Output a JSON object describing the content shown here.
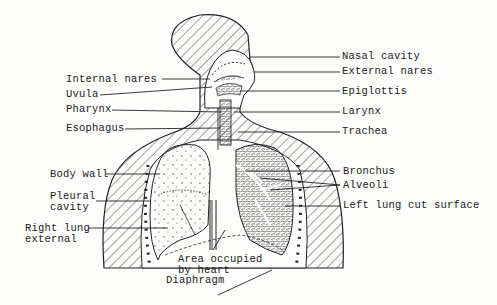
{
  "diagram": {
    "labels_left": {
      "internal_nares": "Internal nares",
      "uvula": "Uvula",
      "pharynx": "Pharynx",
      "esophagus": "Esophagus",
      "body_wall": "Body wall",
      "pleural_cavity_1": "Pleural",
      "pleural_cavity_2": "cavity",
      "right_lung_1": "Right lung",
      "right_lung_2": "external"
    },
    "labels_right": {
      "nasal_cavity": "Nasal cavity",
      "external_nares": "External nares",
      "epiglottis": "Epiglottis",
      "larynx": "Larynx",
      "trachea": "Trachea",
      "bronchus": "Bronchus",
      "alveoli": "Alveoli",
      "left_lung": "Left lung cut surface"
    },
    "labels_bottom": {
      "heart_1": "Area occupied",
      "heart_2": "by heart",
      "diaphragm": "Diaphragm"
    },
    "colors": {
      "ink": "#222222",
      "paper": "#fdfdfb"
    }
  }
}
